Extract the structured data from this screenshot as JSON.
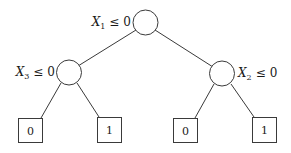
{
  "diagram": {
    "type": "decision-tree",
    "root": {
      "variable": "X",
      "subscript": "1",
      "relation": "≤",
      "threshold": "0"
    },
    "internal_nodes": [
      {
        "variable": "X",
        "subscript": "3",
        "relation": "≤",
        "threshold": "0"
      },
      {
        "variable": "X",
        "subscript": "2",
        "relation": "≤",
        "threshold": "0"
      }
    ],
    "leaves": [
      {
        "label": "0"
      },
      {
        "label": "1"
      },
      {
        "label": "0"
      },
      {
        "label": "1"
      }
    ]
  }
}
